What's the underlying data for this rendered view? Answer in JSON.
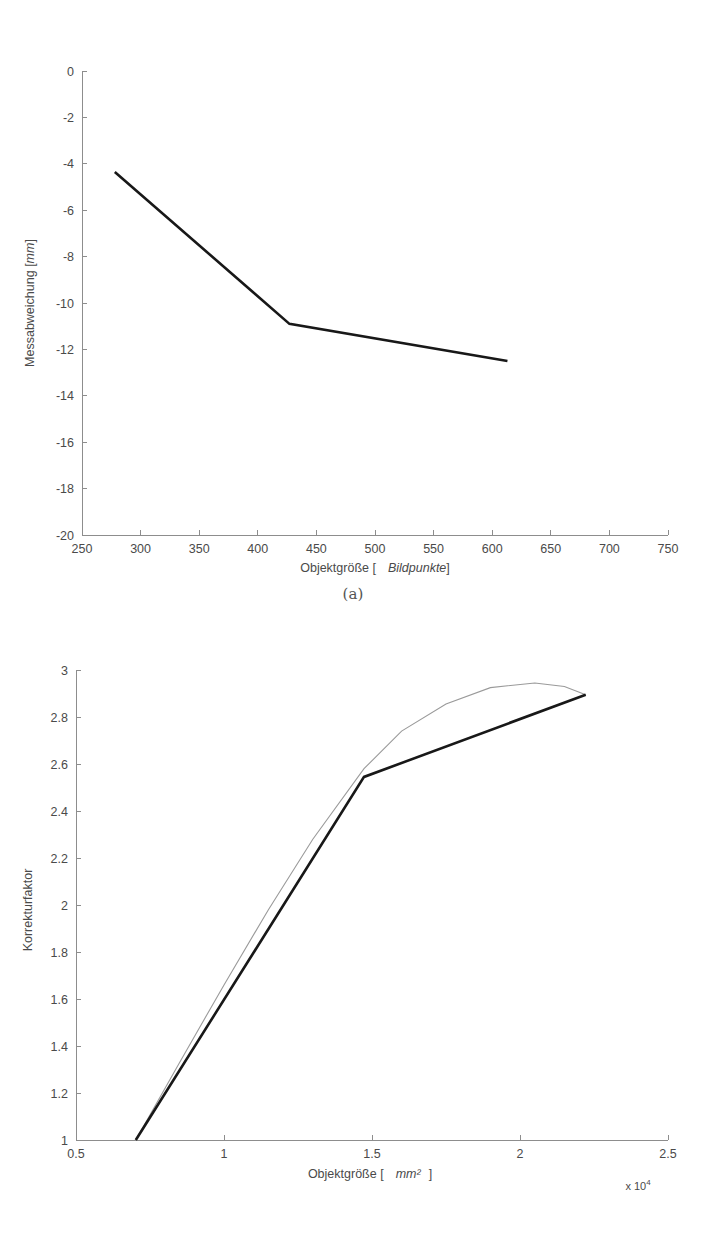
{
  "page": {
    "background": "#ffffff",
    "width": 706,
    "height": 1252
  },
  "figures": [
    {
      "caption": "(a)"
    },
    {
      "caption": "(b)"
    }
  ],
  "colors": {
    "axis": "#8d8d8d",
    "text": "#4a4a4a",
    "series_measured": "#181818",
    "series_model": "#9a9a9a"
  },
  "chart_data": [
    {
      "type": "line",
      "id": "messabweichung",
      "title": "",
      "xlabel": "Objektgröße [   Bildpunkte]",
      "xlabel_plain": "Objektgröße [",
      "xlabel_italic": "Bildpunkte",
      "xlabel_tail": "]",
      "ylabel": "Messabweichung [mm]",
      "ylabel_plain": "Messabweichung [",
      "ylabel_italic": "mm",
      "ylabel_tail": "]",
      "xlim": [
        250,
        750
      ],
      "ylim": [
        -20,
        0
      ],
      "xticks": [
        250,
        300,
        350,
        400,
        450,
        500,
        550,
        600,
        650,
        700,
        750
      ],
      "xtick_labels": [
        "250",
        "300",
        "350",
        "400",
        "450",
        "500",
        "550",
        "600",
        "650",
        "700",
        "750"
      ],
      "yticks": [
        0,
        -2,
        -4,
        -6,
        -8,
        -10,
        -12,
        -14,
        -16,
        -18,
        -20
      ],
      "ytick_labels": [
        "0",
        "-2",
        "-4",
        "-6",
        "-8",
        "-10",
        "-12",
        "-14",
        "-16",
        "-18",
        "-20"
      ],
      "grid": false,
      "legend": "none",
      "series": [
        {
          "name": "Messabweichung",
          "color": "#181818",
          "x": [
            278,
            427,
            613
          ],
          "y": [
            -4.35,
            -10.9,
            -12.5
          ]
        }
      ]
    },
    {
      "type": "line",
      "id": "korrekturfaktor",
      "title": "",
      "xlabel": "Objektgröße [   mm²  ]",
      "xlabel_plain": "Objektgröße [",
      "xlabel_italic": "mm²",
      "xlabel_tail": "]",
      "ylabel": "Korrekturfaktor",
      "x_multiplier": "x 10",
      "x_multiplier_exponent": "4",
      "xlim": [
        0.5,
        2.5
      ],
      "ylim": [
        1,
        3
      ],
      "xticks": [
        0.5,
        1,
        1.5,
        2,
        2.5
      ],
      "xtick_labels": [
        "0.5",
        "1",
        "1.5",
        "2",
        "2.5"
      ],
      "yticks": [
        1,
        1.2,
        1.4,
        1.6,
        1.8,
        2,
        2.2,
        2.4,
        2.6,
        2.8,
        3
      ],
      "ytick_labels": [
        "1",
        "1.2",
        "1.4",
        "1.6",
        "1.8",
        "2",
        "2.2",
        "2.4",
        "2.6",
        "2.8",
        "3"
      ],
      "grid": false,
      "legend": "none",
      "series": [
        {
          "name": "Korrekturfaktor (stückweise linear)",
          "color": "#181818",
          "style": "thick",
          "x": [
            0.702,
            1.473,
            2.222
          ],
          "y": [
            1.0,
            2.545,
            2.895
          ]
        },
        {
          "name": "Korrekturfaktor (Modellkurve)",
          "color": "#9a9a9a",
          "style": "thin",
          "x": [
            0.702,
            0.85,
            1.0,
            1.15,
            1.3,
            1.473,
            1.6,
            1.75,
            1.9,
            2.05,
            2.15,
            2.222
          ],
          "y": [
            1.0,
            1.33,
            1.66,
            1.98,
            2.28,
            2.58,
            2.74,
            2.855,
            2.925,
            2.945,
            2.93,
            2.895
          ]
        }
      ]
    }
  ]
}
